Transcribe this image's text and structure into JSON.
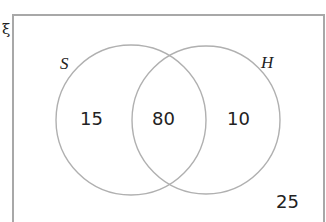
{
  "diagram": {
    "type": "venn",
    "universal_symbol": "ξ",
    "sets": [
      {
        "name": "S",
        "only": "15"
      },
      {
        "name": "H",
        "only": "10"
      }
    ],
    "intersection": "80",
    "outside": "25",
    "colors": {
      "lines": "#a8a8a8",
      "text": "#222222"
    }
  }
}
